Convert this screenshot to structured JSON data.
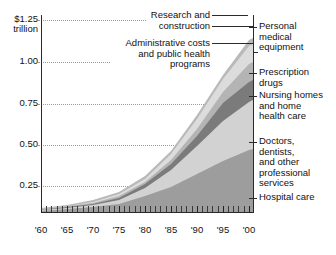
{
  "chart_data": {
    "type": "area",
    "stacked": true,
    "title": "",
    "subtitle": "",
    "xlabel": "",
    "ylabel": "$1.25 trillion",
    "xlim": [
      1960,
      2001
    ],
    "ylim": [
      0,
      1.32
    ],
    "y_unit": "trillions of dollars",
    "grid": true,
    "grid_style": "dotted horizontal",
    "legend_position": "callout labels at left and right of plot",
    "x": [
      1960,
      1965,
      1970,
      1975,
      1980,
      1985,
      1990,
      1995,
      2000
    ],
    "xticklabels": [
      "'60",
      "'65",
      "'70",
      "'75",
      "'80",
      "'85",
      "'90",
      "'95",
      "'00"
    ],
    "x_minor_ticks": "every year",
    "yticks": [
      0.25,
      0.5,
      0.75,
      1.0,
      1.25
    ],
    "yticklabels": [
      "0.25",
      "0.50",
      "0.75",
      "1.00",
      "$1.25"
    ],
    "series": [
      {
        "name": "Hospital care",
        "order": 1,
        "color": "#9d9d9d",
        "values": [
          0.009,
          0.014,
          0.028,
          0.052,
          0.102,
          0.168,
          0.253,
          0.344,
          0.412
        ]
      },
      {
        "name": "Doctors, dentists, and other professional services",
        "order": 2,
        "color": "#d2d2d2",
        "values": [
          0.007,
          0.01,
          0.019,
          0.034,
          0.067,
          0.119,
          0.2,
          0.269,
          0.32
        ]
      },
      {
        "name": "Nursing homes and home health care",
        "order": 3,
        "color": "#7b7b7b",
        "values": [
          0.001,
          0.002,
          0.005,
          0.012,
          0.024,
          0.042,
          0.071,
          0.119,
          0.134
        ]
      },
      {
        "name": "Prescription drugs",
        "order": 4,
        "color": "#b4b4b4",
        "values": [
          0.003,
          0.004,
          0.006,
          0.009,
          0.014,
          0.024,
          0.042,
          0.069,
          0.122
        ]
      },
      {
        "name": "Administrative costs and public health programs",
        "order": 5,
        "color": "#dcdcdc",
        "values": [
          0.002,
          0.003,
          0.006,
          0.012,
          0.019,
          0.036,
          0.061,
          0.087,
          0.12
        ]
      },
      {
        "name": "Research and construction",
        "order": 6,
        "color": "#b9b9b9",
        "values": [
          0.005,
          0.008,
          0.011,
          0.013,
          0.016,
          0.02,
          0.026,
          0.03,
          0.035
        ]
      }
    ],
    "totals": [
      0.027,
      0.041,
      0.075,
      0.132,
      0.242,
      0.409,
      0.653,
      0.918,
      1.143
    ],
    "annotations": {
      "left": [
        {
          "id": "research-construction",
          "text": "Research and\nconstruction"
        },
        {
          "id": "administrative-public-health",
          "text": "Administrative costs\nand public health\nprograms"
        }
      ],
      "right": [
        {
          "id": "personal-medical-equipment",
          "text": "Personal\nmedical\nequipment"
        },
        {
          "id": "prescription-drugs",
          "text": "Prescription\ndrugs"
        },
        {
          "id": "nursing-home-health",
          "text": "Nursing homes\nand home\nhealth care"
        },
        {
          "id": "doctors-dentists",
          "text": "Doctors,\ndentists,\nand other\nprofessional\nservices"
        },
        {
          "id": "hospital-care",
          "text": "Hospital care"
        }
      ]
    }
  },
  "axis": {
    "y_top_value": "$1.25",
    "y_top_unit": "trillion",
    "y_1_00": "1.00",
    "y_0_75": "0.75",
    "y_0_50": "0.50",
    "y_0_25": "0.25",
    "x_1960": "'60",
    "x_1965": "'65",
    "x_1970": "'70",
    "x_1975": "'75",
    "x_1980": "'80",
    "x_1985": "'85",
    "x_1990": "'90",
    "x_1995": "'95",
    "x_2000": "'00"
  },
  "labels": {
    "research_construction": "Research and\nconstruction",
    "administrative_public_health": "Administrative costs\nand public health\nprograms",
    "personal_medical_equipment": "Personal\nmedical\nequipment",
    "prescription_drugs": "Prescription\ndrugs",
    "nursing_home_health": "Nursing homes\nand home\nhealth care",
    "doctors_dentists": "Doctors,\ndentists,\nand other\nprofessional\nservices",
    "hospital_care": "Hospital care"
  },
  "colors": {
    "hospital": "#9d9d9d",
    "doctors": "#d2d2d2",
    "nursing": "#7b7b7b",
    "drugs": "#b4b4b4",
    "admin": "#dcdcdc",
    "research": "#b9b9b9",
    "axis": "#2a2a2a",
    "grid": "#9a9a9a",
    "text": "#111111"
  }
}
